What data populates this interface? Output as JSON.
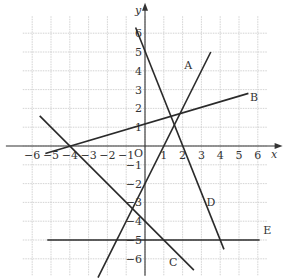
{
  "chart_data": {
    "type": "line",
    "title": "",
    "xlabel": "x",
    "ylabel": "y",
    "origin_label": "O",
    "xlim": [
      -7,
      7
    ],
    "ylim": [
      -7,
      7
    ],
    "grid": true,
    "x_ticks": [
      -6,
      -5,
      -4,
      -3,
      -2,
      -1,
      1,
      2,
      3,
      4,
      5,
      6
    ],
    "y_ticks": [
      -6,
      -5,
      -4,
      -3,
      -2,
      -1,
      1,
      2,
      3,
      4,
      5,
      6
    ],
    "x_tick_labels": [
      "−6",
      "−5",
      "−4",
      "−3",
      "−2",
      "−1",
      "1",
      "2",
      "3",
      "4",
      "5",
      "6"
    ],
    "y_tick_labels": [
      "−6",
      "−5",
      "−4",
      "−3",
      "−2",
      "−1",
      "1",
      "2",
      "3",
      "4",
      "5",
      "6"
    ],
    "series": [
      {
        "name": "A",
        "equation": "y = 2x - 2",
        "x": [
          -2.5,
          3.5
        ],
        "y": [
          -7,
          5
        ],
        "label_at": [
          2.3,
          4.1
        ]
      },
      {
        "name": "B",
        "equation": "y = 0.3x + 1.2",
        "x": [
          -5.3,
          5.5
        ],
        "y": [
          -0.4,
          2.8
        ],
        "label_at": [
          5.8,
          2.4
        ]
      },
      {
        "name": "C",
        "equation": "y = -x - 4",
        "x": [
          -5.6,
          2.6
        ],
        "y": [
          1.6,
          -6.6
        ],
        "label_at": [
          1.5,
          -6.4
        ]
      },
      {
        "name": "D",
        "equation": "y = -2.5x + 5",
        "x": [
          -0.5,
          4.2
        ],
        "y": [
          6.3,
          -5.5
        ],
        "label_at": [
          3.5,
          -3.2
        ]
      },
      {
        "name": "E",
        "equation": "y = -5",
        "x": [
          -5.2,
          6.1
        ],
        "y": [
          -5,
          -5
        ],
        "label_at": [
          6.5,
          -4.7
        ]
      }
    ]
  }
}
